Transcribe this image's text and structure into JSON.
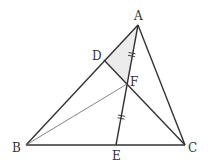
{
  "diagram": {
    "type": "geometry-triangle",
    "colors": {
      "line": "#333333",
      "thin_line": "#666666",
      "shade": "#ececec",
      "background": "#ffffff"
    },
    "points": {
      "A": {
        "label": "A",
        "x": 138,
        "y": 25
      },
      "B": {
        "label": "B",
        "x": 26,
        "y": 145
      },
      "C": {
        "label": "C",
        "x": 185,
        "y": 145
      },
      "D": {
        "label": "D",
        "x": 104,
        "y": 60
      },
      "E": {
        "label": "E",
        "x": 116,
        "y": 145
      },
      "F": {
        "label": "F",
        "x": 127,
        "y": 84
      }
    },
    "segments": [
      "AB",
      "BC",
      "CA",
      "AE",
      "DC",
      "BF"
    ],
    "shaded_region": [
      "A",
      "D",
      "F"
    ],
    "equal_marks": {
      "description": "AF = FE (double tick marks)",
      "segments": [
        "AF",
        "FE"
      ]
    },
    "labels": {
      "A": "A",
      "B": "B",
      "C": "C",
      "D": "D",
      "E": "E",
      "F": "F"
    }
  }
}
